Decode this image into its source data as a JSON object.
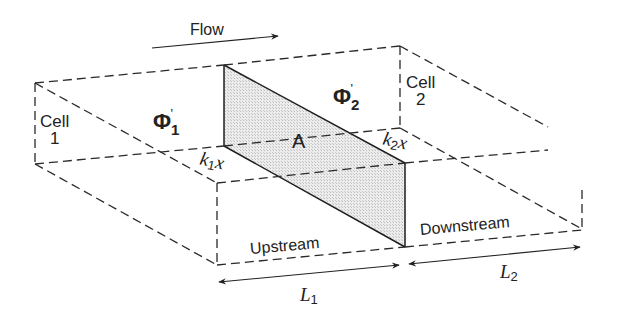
{
  "diagram": {
    "type": "two-cell flow interface schematic",
    "flow_label": "Flow",
    "cells": [
      {
        "label": "Cell",
        "number": "1",
        "potential_symbol": "Φ",
        "potential_sub": "1",
        "potential_prime": "'"
      },
      {
        "label": "Cell",
        "number": "2",
        "potential_symbol": "Φ",
        "potential_sub": "2",
        "potential_prime": "'"
      }
    ],
    "interface_label": "A",
    "conductivities": [
      {
        "symbol": "k",
        "sub": "1",
        "var": "x"
      },
      {
        "symbol": "k",
        "sub": "2",
        "var": "x"
      }
    ],
    "region_labels": {
      "upstream": "Upstream",
      "downstream": "Downstream"
    },
    "lengths": [
      {
        "symbol": "L",
        "sub": "1"
      },
      {
        "symbol": "L",
        "sub": "2"
      }
    ],
    "colors": {
      "line": "#2a2a2a",
      "interface_fill": "#e4e4e4",
      "background": "#ffffff"
    }
  }
}
